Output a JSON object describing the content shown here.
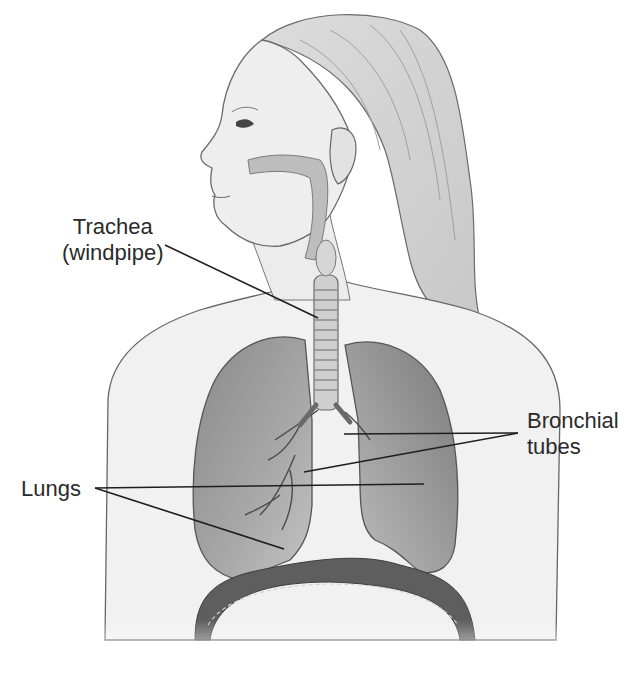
{
  "diagram": {
    "style": "grayscale pencil illustration, female figure, left-facing profile head, torso cutaway",
    "colors": {
      "background": "#ffffff",
      "skin": "#eeeeee",
      "outline": "#555555",
      "lung": "#9a9a9a",
      "lung_dark": "#6e6e6e",
      "diaphragm": "#5e5e5e",
      "leader_line": "#1e1e1e",
      "label_text": "#2a2a2a"
    }
  },
  "labels": {
    "trachea": {
      "line1": "Trachea",
      "line2": "(windpipe)"
    },
    "bronchial": {
      "line1": "Bronchial",
      "line2": "tubes"
    },
    "lungs": {
      "text": "Lungs"
    }
  }
}
